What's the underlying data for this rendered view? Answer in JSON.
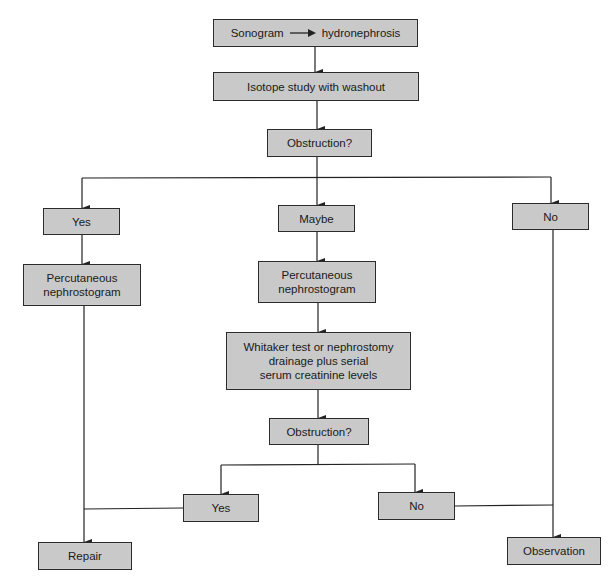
{
  "diagram": {
    "type": "flowchart",
    "colors": {
      "node_fill": "#c9c9c9",
      "node_border": "#2a2a2a",
      "edge": "#222222",
      "background": "#ffffff"
    },
    "nodes": {
      "sonogram": {
        "left": "Sonogram",
        "right": "hydronephrosis"
      },
      "isotope": "Isotope study with washout",
      "obstruction1": "Obstruction?",
      "yes1": "Yes",
      "maybe": "Maybe",
      "no1": "No",
      "perc_left": "Percutaneous\nnephrostogram",
      "perc_mid": "Percutaneous\nnephrostogram",
      "whitaker": "Whitaker test or nephrostomy\ndrainage plus serial\nserum creatinine levels",
      "obstruction2": "Obstruction?",
      "yes2": "Yes",
      "no2": "No",
      "repair": "Repair",
      "observation": "Observation"
    },
    "edges": [
      [
        "sonogram",
        "isotope"
      ],
      [
        "isotope",
        "obstruction1"
      ],
      [
        "obstruction1",
        "yes1"
      ],
      [
        "obstruction1",
        "maybe"
      ],
      [
        "obstruction1",
        "no1"
      ],
      [
        "yes1",
        "perc_left"
      ],
      [
        "perc_left",
        "repair"
      ],
      [
        "maybe",
        "perc_mid"
      ],
      [
        "perc_mid",
        "whitaker"
      ],
      [
        "whitaker",
        "obstruction2"
      ],
      [
        "obstruction2",
        "yes2"
      ],
      [
        "obstruction2",
        "no2"
      ],
      [
        "yes2",
        "repair"
      ],
      [
        "no1",
        "observation"
      ],
      [
        "no2",
        "observation"
      ]
    ]
  }
}
